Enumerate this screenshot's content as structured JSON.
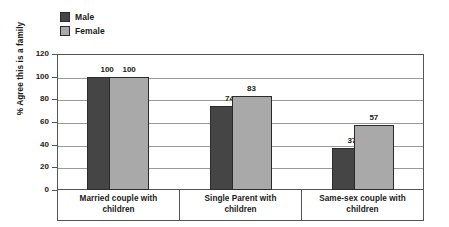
{
  "chart_data": {
    "type": "bar",
    "title": "",
    "subtitle": "",
    "xlabel": "",
    "ylabel": "% Agree this is a family",
    "ylim": [
      0,
      120
    ],
    "ytick_step": 20,
    "yticks": [
      "120",
      "100",
      "80",
      "60",
      "40",
      "20",
      "0"
    ],
    "grid": true,
    "legend_position": "top-left",
    "categories": [
      "Married couple with children",
      "Single Parent with children",
      "Same-sex couple with children"
    ],
    "category_lines": [
      [
        "Married couple with",
        "children"
      ],
      [
        "Single Parent with",
        "children"
      ],
      [
        "Same-sex couple with",
        "children"
      ]
    ],
    "series": [
      {
        "name": "Male",
        "color": "#454545",
        "values": [
          100,
          74,
          37
        ],
        "labels": [
          "100",
          "74",
          "37"
        ]
      },
      {
        "name": "Female",
        "color": "#a9a9a9",
        "values": [
          100,
          83,
          57
        ],
        "labels": [
          "100",
          "83",
          "57"
        ]
      }
    ]
  },
  "legend": {
    "items": [
      {
        "label": "Male",
        "color": "#454545"
      },
      {
        "label": "Female",
        "color": "#a9a9a9"
      }
    ]
  },
  "colors": {
    "male": "#454545",
    "female": "#a9a9a9",
    "axis": "#555555",
    "gridline": "#9a9a9a",
    "text": "#1a1a1a",
    "background": "#ffffff"
  }
}
